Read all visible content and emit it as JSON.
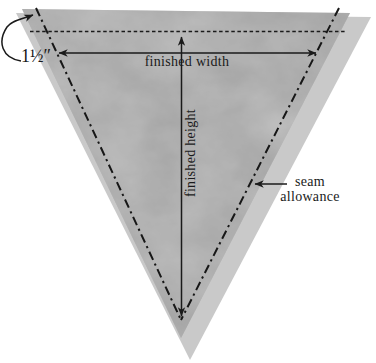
{
  "diagram": {
    "labels": {
      "top_allowance": "1½″",
      "finished_width": "finished width",
      "finished_height": "finished height",
      "seam_allowance": "seam allowance"
    },
    "colors": {
      "background": "#ffffff",
      "fabric": "#9e9e9e",
      "fabric_shadow": "#c9c9c9",
      "line_and_text": "#1a1a1a"
    }
  }
}
